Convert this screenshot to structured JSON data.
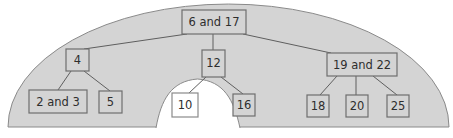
{
  "diagram": {
    "type": "tree",
    "colors": {
      "background": "#ffffff",
      "dome_fill": "#d4d4d4",
      "dome_outline": "#8a8a8a",
      "node_fill": "#d4d4d4",
      "node_border": "#6e6e6e",
      "highlight_node_fill": "#ffffff",
      "edge_color": "#5f5f5f",
      "text_color": "#2e2e2e"
    },
    "nodes": [
      {
        "id": "n0",
        "label": "6 and 17",
        "level": 0,
        "highlighted": false
      },
      {
        "id": "n1",
        "label": "4",
        "level": 1,
        "highlighted": false
      },
      {
        "id": "n2",
        "label": "12",
        "level": 1,
        "highlighted": false
      },
      {
        "id": "n3",
        "label": "19 and 22",
        "level": 1,
        "highlighted": false
      },
      {
        "id": "n4",
        "label": "2 and 3",
        "level": 2,
        "highlighted": false
      },
      {
        "id": "n5",
        "label": "5",
        "level": 2,
        "highlighted": false
      },
      {
        "id": "n6",
        "label": "10",
        "level": 2,
        "highlighted": true
      },
      {
        "id": "n7",
        "label": "16",
        "level": 2,
        "highlighted": false
      },
      {
        "id": "n8",
        "label": "18",
        "level": 2,
        "highlighted": false
      },
      {
        "id": "n9",
        "label": "20",
        "level": 2,
        "highlighted": false
      },
      {
        "id": "n10",
        "label": "25",
        "level": 2,
        "highlighted": false
      }
    ],
    "edges": [
      [
        "6 and 17",
        "4"
      ],
      [
        "6 and 17",
        "12"
      ],
      [
        "6 and 17",
        "19 and 22"
      ],
      [
        "4",
        "2 and 3"
      ],
      [
        "4",
        "5"
      ],
      [
        "12",
        "10"
      ],
      [
        "12",
        "16"
      ],
      [
        "19 and 22",
        "18"
      ],
      [
        "19 and 22",
        "20"
      ],
      [
        "19 and 22",
        "25"
      ]
    ]
  }
}
